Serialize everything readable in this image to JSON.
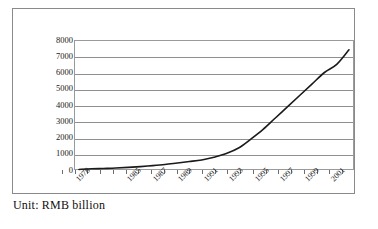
{
  "caption": "Unit: RMB billion",
  "chart_data": {
    "type": "line",
    "title": "",
    "subtitle": "",
    "xlabel": "",
    "ylabel": "",
    "unit": "RMB billion",
    "grid": true,
    "legend": "none",
    "ylim": [
      0,
      8000
    ],
    "y_ticks": [
      8000,
      7000,
      6000,
      5000,
      4000,
      3000,
      2000,
      1000,
      0
    ],
    "y_tick_labels": [
      "8000",
      "7000",
      "6000",
      "5000",
      "4000",
      "3000",
      "2000",
      "1000",
      "0"
    ],
    "x_tick_labels": [
      "1978",
      "1985",
      "1987",
      "1989",
      "1991",
      "1993",
      "1995",
      "1997",
      "1999",
      "2001"
    ],
    "x_tick_count": 22,
    "line_color": "#1a1a1a",
    "grid_color": "#8f8f8f",
    "x": [
      "1978",
      "1981",
      "1982",
      "1983",
      "1984",
      "1985",
      "1986",
      "1987",
      "1988",
      "1989",
      "1990",
      "1991",
      "1992",
      "1993",
      "1994",
      "1995",
      "1996",
      "1997",
      "1998",
      "1999",
      "2000",
      "2001",
      "2002"
    ],
    "series": [
      {
        "name": "Total",
        "values": [
          35,
          75,
          95,
          120,
          160,
          210,
          270,
          340,
          430,
          520,
          620,
          790,
          1010,
          1350,
          1900,
          2500,
          3200,
          3900,
          4600,
          5300,
          6000,
          6500,
          7400
        ]
      }
    ]
  },
  "axis_labels": {
    "years": [
      {
        "text": "1978",
        "pos": 0.5
      },
      {
        "text": "1985",
        "pos": 4.5
      },
      {
        "text": "1987",
        "pos": 6.5
      },
      {
        "text": "1989",
        "pos": 8.5
      },
      {
        "text": "1991",
        "pos": 10.5
      },
      {
        "text": "1993",
        "pos": 12.5
      },
      {
        "text": "1995",
        "pos": 14.5
      },
      {
        "text": "1997",
        "pos": 16.5
      },
      {
        "text": "1999",
        "pos": 18.5
      },
      {
        "text": "2001",
        "pos": 20.5
      }
    ]
  }
}
